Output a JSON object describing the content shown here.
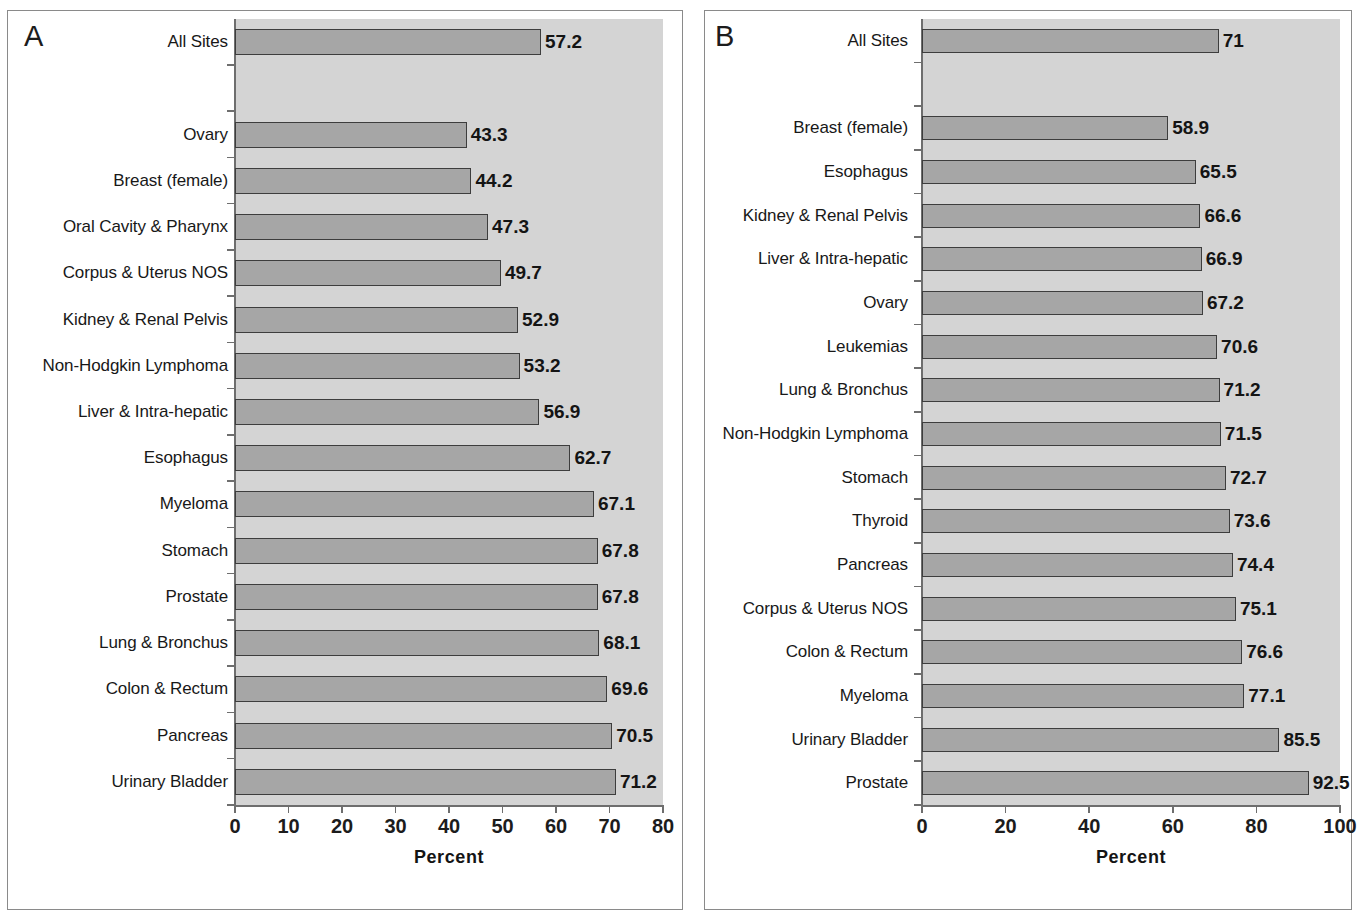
{
  "figure": {
    "panels": [
      {
        "letter": "A",
        "axis_title": "Percent",
        "x_ticks": [
          "0",
          "10",
          "20",
          "30",
          "40",
          "50",
          "60",
          "70",
          "80"
        ]
      },
      {
        "letter": "B",
        "axis_title": "Percent",
        "x_ticks": [
          "0",
          "20",
          "40",
          "60",
          "80",
          "100"
        ]
      }
    ]
  },
  "colors": {
    "plot_background": "#d4d4d4",
    "bar_fill": "#a6a6a6",
    "bar_border": "#3d3d3d",
    "axis": "#6e6e6e",
    "text": "#141414",
    "frame": "#8a8a8a"
  },
  "chart_data": [
    {
      "type": "bar",
      "title": "A",
      "orientation": "horizontal",
      "xlabel": "Percent",
      "ylabel": "",
      "xlim": [
        0,
        80
      ],
      "xticks": [
        0,
        10,
        20,
        30,
        40,
        50,
        60,
        70,
        80
      ],
      "grid": false,
      "legend": null,
      "value_labels": true,
      "categories": [
        "All Sites",
        "",
        "Ovary",
        "Breast (female)",
        "Oral Cavity & Pharynx",
        "Corpus & Uterus NOS",
        "Kidney & Renal Pelvis",
        "Non-Hodgkin Lymphoma",
        "Liver & Intra-hepatic",
        "Esophagus",
        "Myeloma",
        "Stomach",
        "Prostate",
        "Lung & Bronchus",
        "Colon & Rectum",
        "Pancreas",
        "Urinary Bladder"
      ],
      "values": [
        57.2,
        null,
        43.3,
        44.2,
        47.3,
        49.7,
        52.9,
        53.2,
        56.9,
        62.7,
        67.1,
        67.8,
        67.8,
        68.1,
        69.6,
        70.5,
        71.2
      ],
      "value_text": [
        "57.2",
        "",
        "43.3",
        "44.2",
        "47.3",
        "49.7",
        "52.9",
        "53.2",
        "56.9",
        "62.7",
        "67.1",
        "67.8",
        "67.8",
        "68.1",
        "69.6",
        "70.5",
        "71.2"
      ]
    },
    {
      "type": "bar",
      "title": "B",
      "orientation": "horizontal",
      "xlabel": "Percent",
      "ylabel": "",
      "xlim": [
        0,
        100
      ],
      "xticks": [
        0,
        20,
        40,
        60,
        80,
        100
      ],
      "grid": false,
      "legend": null,
      "value_labels": true,
      "categories": [
        "All Sites",
        "",
        "Breast (female)",
        "Esophagus",
        "Kidney & Renal Pelvis",
        "Liver & Intra-hepatic",
        "Ovary",
        "Leukemias",
        "Lung & Bronchus",
        "Non-Hodgkin Lymphoma",
        "Stomach",
        "Thyroid",
        "Pancreas",
        "Corpus & Uterus NOS",
        "Colon & Rectum",
        "Myeloma",
        "Urinary Bladder",
        "Prostate"
      ],
      "values": [
        71,
        null,
        58.9,
        65.5,
        66.6,
        66.9,
        67.2,
        70.6,
        71.2,
        71.5,
        72.7,
        73.6,
        74.4,
        75.1,
        76.6,
        77.1,
        85.5,
        92.5
      ],
      "value_text": [
        "71",
        "",
        "58.9",
        "65.5",
        "66.6",
        "66.9",
        "67.2",
        "70.6",
        "71.2",
        "71.5",
        "72.7",
        "73.6",
        "74.4",
        "75.1",
        "76.6",
        "77.1",
        "85.5",
        "92.5"
      ]
    }
  ]
}
